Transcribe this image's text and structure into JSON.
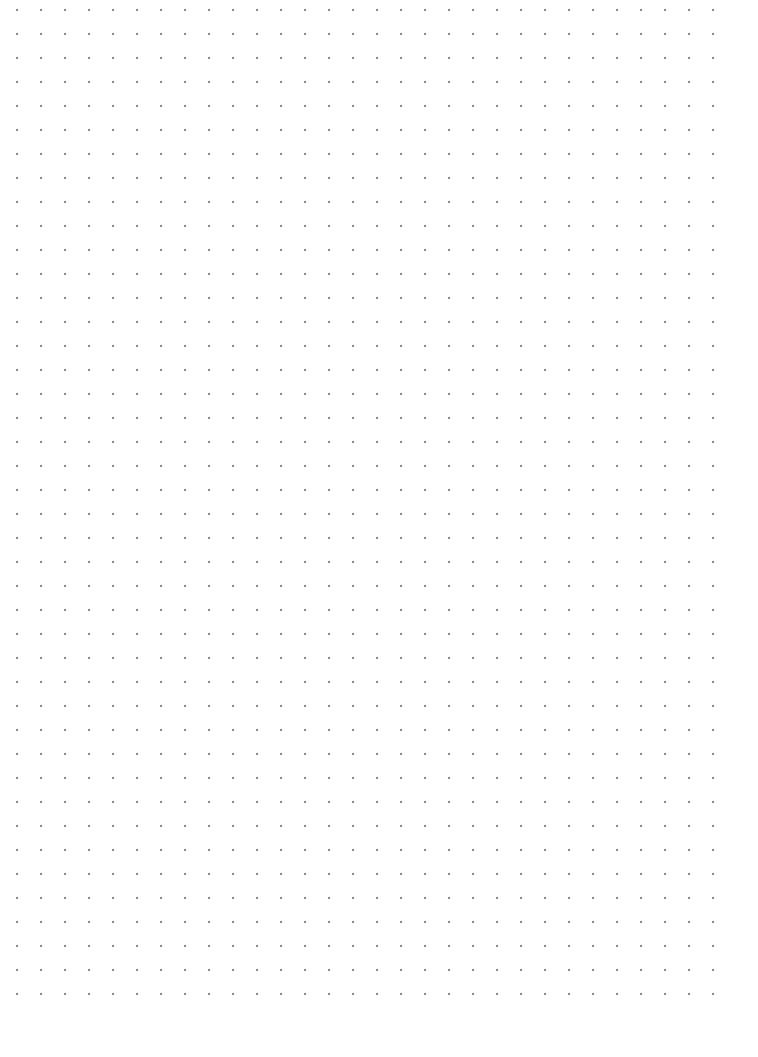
{
  "page": {
    "type": "dot-grid-paper",
    "width": 758,
    "height": 1057,
    "background_color": "#ffffff",
    "content_text": ""
  },
  "grid": {
    "dot_color": "#8a8a96",
    "dot_size": 2,
    "spacing_x": 24,
    "spacing_y": 24,
    "columns": 30,
    "rows": 41,
    "origin_x": 17,
    "origin_y": 34,
    "last_dot_x": 717,
    "last_dot_y": 993,
    "margin_left": 17,
    "margin_right": 41,
    "margin_top": 34,
    "margin_bottom": 64
  }
}
